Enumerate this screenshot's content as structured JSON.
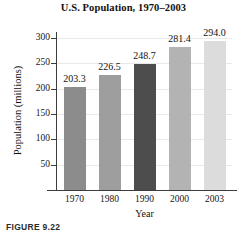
{
  "figure": {
    "caption": "FIGURE 9.22"
  },
  "chart_data": {
    "type": "bar",
    "title": "U.S. Population, 1970–2003",
    "xlabel": "Year",
    "ylabel": "Population (millions)",
    "categories": [
      "1970",
      "1980",
      "1990",
      "2000",
      "2003"
    ],
    "values": [
      203.3,
      226.5,
      248.7,
      281.4,
      294.0
    ],
    "value_labels": [
      "203.3",
      "226.5",
      "248.7",
      "281.4",
      "294.0"
    ],
    "bar_colors": [
      "#8c8c8c",
      "#9e9e9e",
      "#4d4d4d",
      "#b3b3b3",
      "#dcdcdc"
    ],
    "ylim": [
      0,
      310
    ],
    "yticks": [
      50,
      100,
      150,
      200,
      250,
      300
    ],
    "ytick_labels": [
      "50",
      "100",
      "150",
      "200",
      "250",
      "300"
    ],
    "grid": true,
    "grid_color": "#e9e9e9",
    "legend": null,
    "axis_color": "#3d3d3d",
    "background": "#ffffff"
  }
}
